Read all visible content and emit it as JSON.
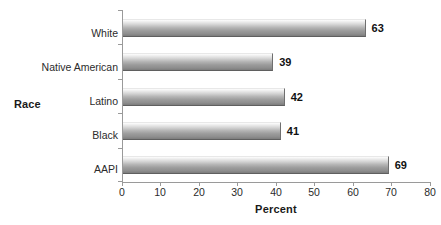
{
  "chart_data": {
    "type": "bar",
    "orientation": "horizontal",
    "title": "",
    "xlabel": "Percent",
    "ylabel": "Race",
    "categories": [
      "White",
      "Native American",
      "Latino",
      "Black",
      "AAPI"
    ],
    "values": [
      63,
      39,
      42,
      41,
      69
    ],
    "value_labels": [
      "63",
      "39",
      "42",
      "41",
      "69"
    ],
    "xlim": [
      0,
      80
    ],
    "xticks": [
      0,
      10,
      20,
      30,
      40,
      50,
      60,
      70,
      80
    ],
    "xtick_labels": [
      "0",
      "10",
      "20",
      "30",
      "40",
      "50",
      "60",
      "70",
      "80"
    ],
    "grid": false,
    "legend": false,
    "bar_color": "#9b9b9b",
    "bar_edge_color": "#5f5f5f",
    "axis_color": "#9a9a9a",
    "text_color": "#2b2b2b"
  }
}
